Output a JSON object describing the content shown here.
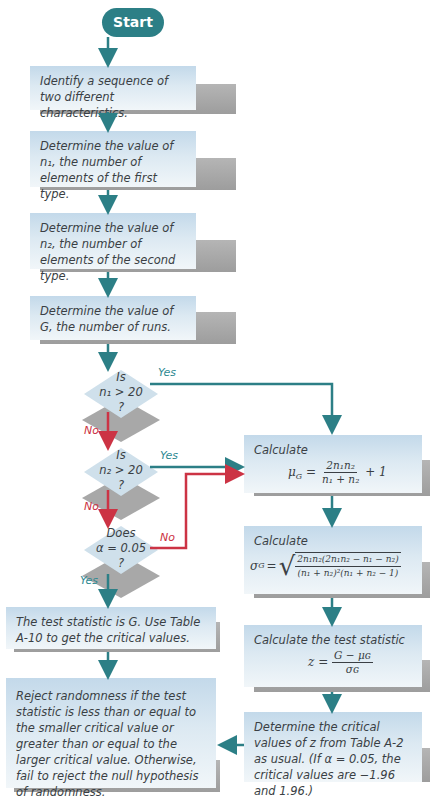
{
  "flowchart": {
    "start": {
      "label": "Start"
    },
    "steps": {
      "identify": "Identify a sequence of two different characteristics.",
      "n1": "Determine the value of n₁, the number of elements of the first type.",
      "n2": "Determine the value of n₂, the number of elements of the second type.",
      "g": "Determine the value of G, the number of runs."
    },
    "decisions": {
      "d1": {
        "line1": "Is",
        "line2": "n₁ > 20",
        "line3": "?"
      },
      "d2": {
        "line1": "Is",
        "line2": "n₂ > 20",
        "line3": "?"
      },
      "d3": {
        "line1": "Does",
        "line2": "α = 0.05",
        "line3": "?"
      }
    },
    "branch_labels": {
      "d1_yes": "Yes",
      "d1_no": "No",
      "d2_yes": "Yes",
      "d2_no": "No",
      "d3_no": "No",
      "d3_yes": "Yes"
    },
    "right_column": {
      "mu": {
        "title": "Calculate",
        "lhs": "μ",
        "lhs_sub": "G",
        "eq": "=",
        "num": "2n₁n₂",
        "den": "n₁ + n₂",
        "tail": "+ 1"
      },
      "sigma": {
        "title": "Calculate",
        "lhs": "σ",
        "lhs_sub": "G",
        "eq": "=",
        "num": "2n₁n₂(2n₁n₂ − n₁ − n₂)",
        "den": "(n₁ + n₂)²(n₁ + n₂ − 1)"
      },
      "z": {
        "title": "Calculate the test statistic",
        "lhs": "z =",
        "num": "G − μɢ",
        "den": "σɢ"
      },
      "critical": "Determine the critical values of z from Table A-2 as usual. (If α = 0.05, the critical values are −1.96 and 1.96.)"
    },
    "left_bottom": {
      "test_stat": "The test statistic is G. Use Table A-10 to get the critical values.",
      "reject": "Reject  randomness if the test statistic is less than or equal to the smaller critical value or greater than or equal to the larger critical value. Otherwise, fail to reject the null hypothesis of randomness."
    },
    "colors": {
      "teal": "#2c7f86",
      "red": "#cc3344",
      "box_top": "#c3d9ea",
      "box_bottom": "#f1f6f9",
      "shadow": "#a8a8a8"
    }
  }
}
